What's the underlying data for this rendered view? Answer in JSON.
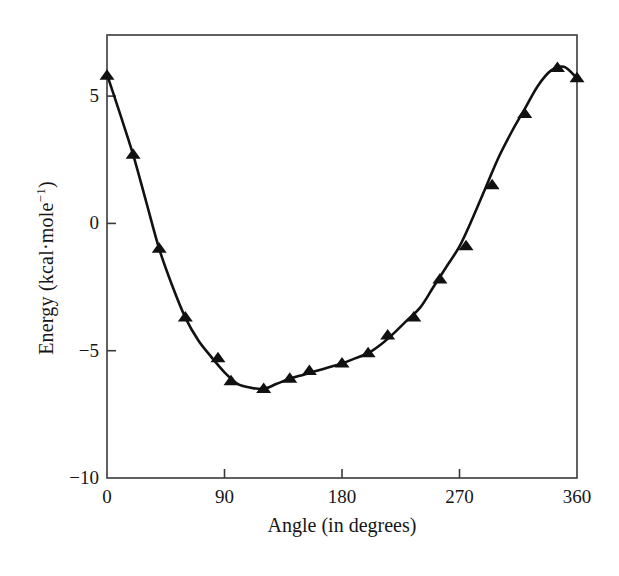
{
  "figure": {
    "background_color": "#ffffff",
    "axis_color": "#3a3a3a",
    "data_color": "#111111"
  },
  "axes": {
    "x_title": "Angle (in degrees)",
    "y_title_main": "Energy (kcal·mole",
    "y_title_exponent": "−1",
    "y_title_close": ")",
    "y_title_full": "Energy (kcal·mole−1)",
    "x_ticks": [
      "0",
      "90",
      "180",
      "270",
      "360"
    ],
    "y_ticks": [
      "5",
      "0",
      "−5",
      "−10"
    ]
  },
  "chart_data": {
    "type": "line",
    "title": "",
    "xlabel": "Angle (in degrees)",
    "ylabel": "Energy (kcal·mole⁻¹)",
    "xlim": [
      0,
      360
    ],
    "ylim": [
      -10,
      7.4
    ],
    "xticks": [
      0,
      90,
      180,
      270,
      360
    ],
    "yticks": [
      5,
      0,
      -5,
      -10
    ],
    "grid": false,
    "legend": null,
    "marker": "triangle-up",
    "series": [
      {
        "name": "Energy",
        "x": [
          0,
          20,
          40,
          60,
          85,
          95,
          120,
          140,
          155,
          180,
          200,
          215,
          235,
          255,
          275,
          295,
          320,
          345,
          360
        ],
        "values": [
          5.8,
          2.7,
          -1.0,
          -3.7,
          -5.3,
          -6.2,
          -6.5,
          -6.1,
          -5.8,
          -5.5,
          -5.1,
          -4.4,
          -3.7,
          -2.2,
          -0.9,
          1.5,
          4.3,
          6.1,
          5.7
        ]
      }
    ],
    "curve": {
      "description": "smooth fitted curve through the marker points",
      "x": [
        0,
        10,
        20,
        30,
        40,
        50,
        60,
        70,
        80,
        90,
        100,
        110,
        120,
        130,
        140,
        150,
        160,
        170,
        180,
        190,
        200,
        210,
        220,
        230,
        240,
        250,
        260,
        270,
        280,
        290,
        300,
        310,
        320,
        330,
        340,
        350,
        360
      ],
      "values": [
        5.85,
        4.3,
        2.7,
        0.85,
        -1.0,
        -2.45,
        -3.7,
        -4.6,
        -5.25,
        -5.85,
        -6.3,
        -6.45,
        -6.5,
        -6.3,
        -6.1,
        -5.95,
        -5.8,
        -5.65,
        -5.5,
        -5.3,
        -5.1,
        -4.75,
        -4.3,
        -3.8,
        -3.3,
        -2.5,
        -1.7,
        -0.9,
        0.2,
        1.4,
        2.6,
        3.6,
        4.5,
        5.4,
        6.0,
        6.15,
        5.7
      ]
    }
  }
}
